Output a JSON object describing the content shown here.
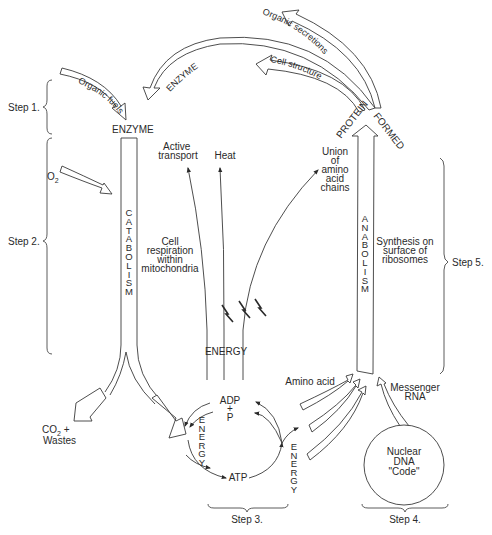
{
  "steps": {
    "step1": "Step 1.",
    "step2": "Step 2.",
    "step3": "Step 3.",
    "step4": "Step 4.",
    "step5": "Step 5."
  },
  "arrows": {
    "organic_fuels": "Organic fuels",
    "enzyme_return": "ENZYME",
    "organic_secretions": "Organic secretions",
    "cell_structure": "Cell structure"
  },
  "labels": {
    "enzyme_top": "ENZYME",
    "o2": "O",
    "o2_sub": "2",
    "catabolism": "CATABOLISM",
    "cell_respiration": [
      "Cell",
      "respiration",
      "within",
      "mitochondria"
    ],
    "active_transport": [
      "Active",
      "transport"
    ],
    "heat": "Heat",
    "union": [
      "Union",
      "of",
      "amino",
      "acid",
      "chains"
    ],
    "protein": "PROTEIN",
    "formed": "FORMED",
    "anabolism": "ANABOLISM",
    "synthesis": [
      "Synthesis on",
      "surface of",
      "ribosomes"
    ],
    "energy_center": "ENERGY",
    "co2": "CO",
    "co2_sub": "2",
    "co2_plus": " +",
    "wastes": "Wastes",
    "energy_left": "ENERGY",
    "energy_right": "ENERGY",
    "adp": "ADP",
    "plus": "+",
    "p": "P",
    "atp": "ATP",
    "amino_acid": "Amino acid",
    "messenger_rna": [
      "Messenger",
      "RNA"
    ],
    "nuclear_dna": [
      "Nuclear",
      "DNA",
      "\"Code\""
    ]
  }
}
